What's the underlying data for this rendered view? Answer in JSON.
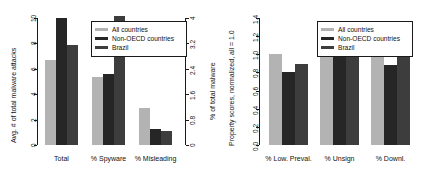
{
  "figure": {
    "width": 439,
    "height": 180,
    "background": "#ffffff"
  },
  "series_colors": {
    "all_countries": "#b3b3b3",
    "non_oecd": "#262626",
    "brazil": "#3d3d3d"
  },
  "legend": {
    "items": [
      {
        "label": "All countries",
        "color": "#b3b3b3",
        "key": "all_countries"
      },
      {
        "label": "Non-OECD countries",
        "color": "#262626",
        "key": "non_oecd"
      },
      {
        "label": "Brazil",
        "color": "#3d3d3d",
        "key": "brazil"
      }
    ]
  },
  "chart_data": [
    {
      "type": "bar",
      "id": "malware-attacks-chart",
      "title": "",
      "categories": [
        "Total",
        "% Spyware",
        "% Misleading"
      ],
      "series": [
        {
          "name": "All countries",
          "values": [
            6.7,
            2.15,
            1.15
          ],
          "color": "#b3b3b3"
        },
        {
          "name": "Non-OECD countries",
          "values": [
            10.0,
            2.25,
            0.5
          ],
          "color": "#262626"
        },
        {
          "name": "Brazil",
          "values": [
            7.85,
            4.05,
            0.45
          ],
          "color": "#3d3d3d"
        }
      ],
      "xlabel": "",
      "ylabel": "Avg. # of total malware attacks",
      "ylim": [
        0,
        10
      ],
      "yticks": [
        "0",
        "2",
        "4",
        "6",
        "8",
        "10"
      ],
      "ytickvals": [
        0,
        2,
        4,
        6,
        8,
        10
      ],
      "y2label": "% of total malware",
      "y2lim": [
        0,
        4
      ],
      "y2ticks": [
        "0",
        "0.8",
        "1.6",
        "2.4",
        "3.2",
        "4"
      ],
      "y2tickvals": [
        0,
        0.8,
        1.6,
        2.4,
        3.2,
        4
      ],
      "grid": false,
      "legend_position": "top-right",
      "note": "Total uses left axis; % Spyware and % Misleading map onto right axis (% of total malware)"
    },
    {
      "type": "bar",
      "id": "property-scores-chart",
      "title": "",
      "categories": [
        "% Low. Preval.",
        "% Unsign",
        "% Downl."
      ],
      "series": [
        {
          "name": "All countries",
          "values": [
            1.0,
            1.0,
            1.0
          ],
          "color": "#b3b3b3"
        },
        {
          "name": "Non-OECD countries",
          "values": [
            0.81,
            0.99,
            0.88
          ],
          "color": "#262626"
        },
        {
          "name": "Brazil",
          "values": [
            0.89,
            0.98,
            1.03
          ],
          "color": "#3d3d3d"
        }
      ],
      "xlabel": "",
      "ylabel": "Property scores, normalized, all = 1.0",
      "ylim": [
        0,
        1.4
      ],
      "yticks": [
        "0.0",
        "0.2",
        "0.4",
        "0.6",
        "0.8",
        "1.0",
        "1.2",
        "1.4"
      ],
      "ytickvals": [
        0,
        0.2,
        0.4,
        0.6,
        0.8,
        1.0,
        1.2,
        1.4
      ],
      "grid": false,
      "legend_position": "top-right"
    }
  ]
}
